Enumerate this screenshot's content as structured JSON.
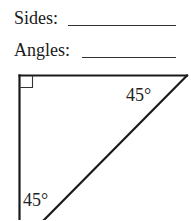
{
  "worksheet": {
    "sides_label": "Sides:",
    "angles_label": "Angles:",
    "sides_answer": "",
    "angles_answer": ""
  },
  "triangle": {
    "type": "right isosceles triangle",
    "right_angle_marker": "top-left",
    "angle_top_right": "45°",
    "angle_bottom_left": "45°",
    "stroke_color": "#1a1a1a"
  }
}
